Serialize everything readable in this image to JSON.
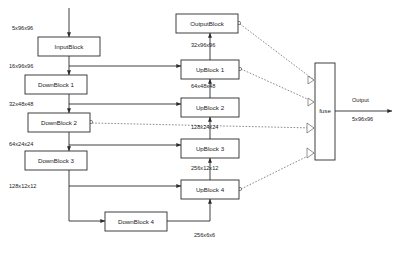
{
  "diagram": {
    "blocks": [
      {
        "id": "input_block",
        "label": "InputBlock",
        "x": 38,
        "y": 37,
        "w": 62,
        "h": 19
      },
      {
        "id": "down_block_1",
        "label": "DownBlock 1",
        "x": 25,
        "y": 75,
        "w": 62,
        "h": 19
      },
      {
        "id": "down_block_2",
        "label": "DownBlock 2",
        "x": 28,
        "y": 113,
        "w": 62,
        "h": 19
      },
      {
        "id": "down_block_3",
        "label": "DownBlock 3",
        "x": 25,
        "y": 151,
        "w": 62,
        "h": 19
      },
      {
        "id": "down_block_4",
        "label": "DownBlock 4",
        "x": 105,
        "y": 212,
        "w": 62,
        "h": 19
      },
      {
        "id": "output_block",
        "label": "OutputBlock",
        "x": 176,
        "y": 14,
        "w": 62,
        "h": 19
      },
      {
        "id": "up_block_1",
        "label": "UpBlock 1",
        "x": 181,
        "y": 60,
        "w": 58,
        "h": 19
      },
      {
        "id": "up_block_2",
        "label": "UpBlock 2",
        "x": 181,
        "y": 98,
        "w": 58,
        "h": 19
      },
      {
        "id": "up_block_3",
        "label": "UpBlock 3",
        "x": 181,
        "y": 139,
        "w": 58,
        "h": 19
      },
      {
        "id": "up_block_4",
        "label": "UpBlock 4",
        "x": 181,
        "y": 180,
        "w": 58,
        "h": 19
      },
      {
        "id": "fuse_block",
        "label": "fuse",
        "x": 315,
        "y": 63,
        "w": 20,
        "h": 97
      }
    ],
    "tensor_labels": [
      {
        "id": "tensor-input",
        "text": "5x96x96",
        "x": 12,
        "y": 29
      },
      {
        "id": "tensor-enc-16",
        "text": "16x96x96",
        "x": 9,
        "y": 67
      },
      {
        "id": "tensor-enc-32",
        "text": "32x48x48",
        "x": 9,
        "y": 105
      },
      {
        "id": "tensor-enc-64",
        "text": "64x24x24",
        "x": 9,
        "y": 145
      },
      {
        "id": "tensor-enc-128",
        "text": "128x12x12",
        "x": 9,
        "y": 187
      },
      {
        "id": "tensor-bottleneck",
        "text": "256x6x6",
        "x": 194,
        "y": 236
      },
      {
        "id": "tensor-dec-32",
        "text": "32x96x96",
        "x": 191,
        "y": 46
      },
      {
        "id": "tensor-dec-64",
        "text": "64x48x48",
        "x": 191,
        "y": 87
      },
      {
        "id": "tensor-dec-128",
        "text": "128x24x24",
        "x": 191,
        "y": 128
      },
      {
        "id": "tensor-dec-256",
        "text": "256x12x12",
        "x": 191,
        "y": 169
      },
      {
        "id": "tensor-output-name",
        "text": "Output",
        "x": 352,
        "y": 101
      },
      {
        "id": "tensor-output-dim",
        "text": "5x96x96",
        "x": 352,
        "y": 120
      }
    ],
    "colors": {
      "stroke": "#2b2b2b",
      "dashed_stroke": "#4a4a4a",
      "background": "#ffffff",
      "text": "#1a1a1a"
    }
  }
}
